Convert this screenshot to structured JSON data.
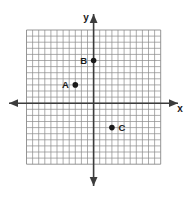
{
  "figure": {
    "name": "coordinate-grid-with-plotted-points",
    "background_color": "#ffffff",
    "grid_color": "#8a8a8a",
    "axis_color": "#3c3c3c",
    "point_color": "#1a1a1a"
  },
  "axes": {
    "x_label": "x",
    "y_label": "y",
    "x_arrow_left": true,
    "x_arrow_right": true,
    "y_arrow_up": true,
    "y_arrow_down": true
  },
  "chart_data": {
    "type": "scatter",
    "title": "",
    "xlabel": "x",
    "ylabel": "y",
    "grid": true,
    "legend": "none",
    "xlim": [
      -11,
      11
    ],
    "ylim": [
      -10,
      12
    ],
    "grid_step": 1,
    "points": [
      {
        "label": "A",
        "x": -3,
        "y": 3,
        "label_position": "left"
      },
      {
        "label": "B",
        "x": 0,
        "y": 7,
        "label_position": "left"
      },
      {
        "label": "C",
        "x": 3,
        "y": -4,
        "label_position": "right"
      }
    ]
  }
}
